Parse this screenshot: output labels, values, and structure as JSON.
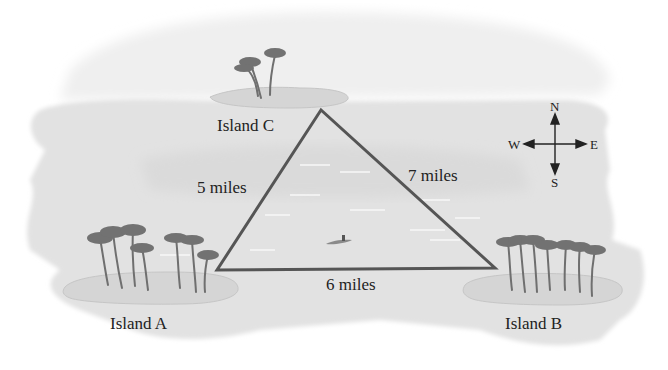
{
  "diagram": {
    "type": "map-triangle",
    "islands": [
      {
        "id": "A",
        "label": "Island A",
        "x": 217,
        "y": 270
      },
      {
        "id": "B",
        "label": "Island B",
        "x": 495,
        "y": 268
      },
      {
        "id": "C",
        "label": "Island C",
        "x": 321,
        "y": 110
      }
    ],
    "edges": [
      {
        "from": "C",
        "to": "A",
        "label": "5 miles"
      },
      {
        "from": "C",
        "to": "B",
        "label": "7 miles"
      },
      {
        "from": "A",
        "to": "B",
        "label": "6 miles"
      }
    ],
    "compass": {
      "north": "N",
      "south": "S",
      "east": "E",
      "west": "W"
    },
    "colors": {
      "triangle": "#555555",
      "water": "#e3e3e3",
      "sand": "#d6d6d6",
      "palm": "#6f6f6f",
      "text": "#222222"
    }
  }
}
